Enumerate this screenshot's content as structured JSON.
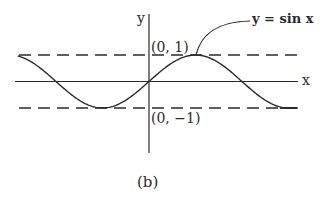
{
  "figure": {
    "caption": "(b)",
    "y_axis_label": "y",
    "x_axis_label": "x",
    "curve_label": "y = sin x",
    "point_top_label": "(0, 1)",
    "point_bottom_label": "(0, −1)"
  },
  "chart_data": {
    "type": "line",
    "title": "",
    "function": "y = sin x",
    "xlabel": "x",
    "ylabel": "y",
    "x_range_radians": [
      -4.43,
      5.03
    ],
    "ylim": [
      -1,
      1
    ],
    "reference_lines": [
      {
        "y": 1,
        "style": "dashed",
        "label": "(0, 1)"
      },
      {
        "y": -1,
        "style": "dashed",
        "label": "(0, -1)"
      }
    ],
    "key_points": [
      {
        "x": 0,
        "y": 0
      },
      {
        "x": 1.5708,
        "y": 1
      },
      {
        "x": 3.1416,
        "y": 0
      },
      {
        "x": -1.5708,
        "y": -1
      },
      {
        "x": -3.1416,
        "y": 0
      },
      {
        "x": 4.7124,
        "y": -1
      }
    ],
    "annotations": [
      "y=sin x (arrow to peak)",
      "(0,1)",
      "(0,-1)"
    ],
    "grid": false,
    "caption": "(b)"
  },
  "colors": {
    "ink": "#2a2a2a",
    "background": "#ffffff"
  }
}
